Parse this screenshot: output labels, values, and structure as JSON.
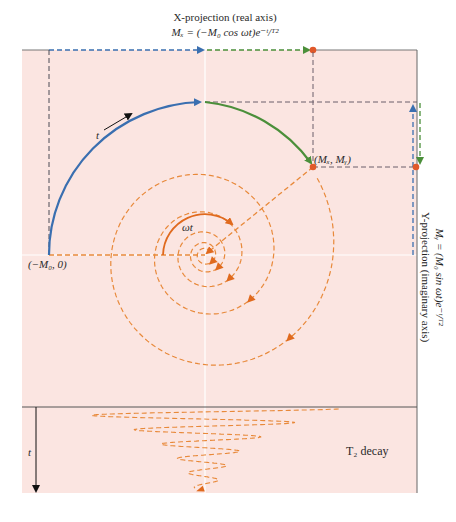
{
  "colors": {
    "background_panel": "#fbe5e1",
    "axis_white": "#ffffff",
    "blue": "#3a6fb0",
    "green": "#4b8f3a",
    "orange": "#e8893a",
    "orange_dark": "#e06a1e",
    "red_dot": "#e0582a",
    "gray_dash": "#6b5f6a",
    "border": "#555555"
  },
  "labels": {
    "x_projection_title": "X-projection (real axis)",
    "x_projection_formula": "Mₓ = (−M₀ cos ωt)e⁻ᵗ/ᵀ²",
    "y_projection_formula": "Mᵧ = (M₀ sin ωt)e⁻ᵗ/ᵀ²",
    "y_projection_title": "Y-projection (imaginary axis)",
    "start_point": "(−M₀, 0)",
    "current_point": "(Mₓ, Mᵧ)",
    "time_arrow": "t",
    "angle": "ωt",
    "decay_time_axis": "t",
    "decay_label": "T₂ decay"
  },
  "spiral": {
    "turns": 5,
    "initial_magnitude": "M₀",
    "rotation_direction": "clockwise"
  }
}
